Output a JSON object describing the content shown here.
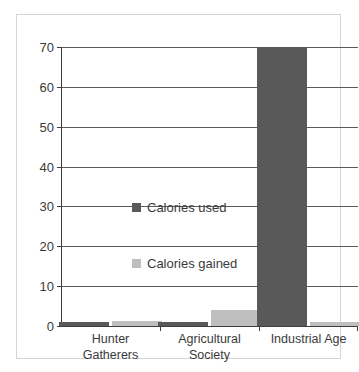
{
  "chart_data": {
    "type": "bar",
    "title": "",
    "xlabel": "",
    "ylabel": "",
    "categories": [
      "Hunter Gatherers",
      "Agricultural Society",
      "Industrial Age"
    ],
    "category_lines": [
      [
        "Hunter",
        "Gatherers"
      ],
      [
        "Agricultural",
        "Society"
      ],
      [
        "Industrial Age",
        ""
      ]
    ],
    "series": [
      {
        "name": "Calories used",
        "color": "#595959",
        "values": [
          1,
          1,
          70
        ]
      },
      {
        "name": "Calories gained",
        "color": "#bfbfbf",
        "values": [
          1.3,
          4,
          1
        ]
      }
    ],
    "ylim": [
      0,
      70
    ],
    "yticks": [
      0,
      10,
      20,
      30,
      40,
      50,
      60,
      70
    ],
    "ytick_labels": [
      "0",
      "10",
      "20",
      "30",
      "40",
      "50",
      "60",
      "70"
    ],
    "grid": true,
    "legend_position": "inside-left"
  },
  "legend": {
    "entries": [
      {
        "label": "Calories used"
      },
      {
        "label": "Calories gained"
      }
    ]
  }
}
